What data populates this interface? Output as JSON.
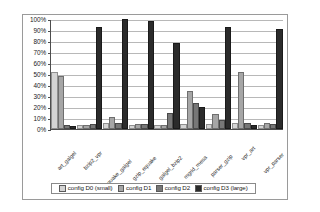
{
  "chart_data": {
    "type": "bar",
    "title": "",
    "xlabel": "",
    "ylabel": "",
    "ylim": [
      0,
      100
    ],
    "ytick_labels": [
      "100%",
      "90%",
      "80%",
      "70%",
      "60%",
      "50%",
      "40%",
      "30%",
      "20%",
      "10%",
      "0%"
    ],
    "ytick_values": [
      100,
      90,
      80,
      70,
      60,
      50,
      40,
      30,
      20,
      10,
      0
    ],
    "grid": true,
    "legend_position": "bottom",
    "categories": [
      "art_galgel",
      "bzip2_vpr",
      "equake_galgel",
      "gzip_equake",
      "galgel_bzip2",
      "mgrid_mesa",
      "parser_gzip",
      "vpr_art",
      "vpr_parser"
    ],
    "series": [
      {
        "name": "config D0 (small)",
        "color": "#d4d4d4",
        "values": [
          50,
          2,
          4,
          2,
          2,
          3,
          3,
          4,
          2
        ]
      },
      {
        "name": "config D1",
        "color": "#a6a6a6",
        "values": [
          46,
          2,
          9,
          3,
          2,
          33,
          12,
          50,
          4
        ]
      },
      {
        "name": "config D2",
        "color": "#777777",
        "values": [
          2,
          3,
          4,
          3,
          13,
          22,
          6,
          4,
          3
        ]
      },
      {
        "name": "config D3 (large)",
        "color": "#2b2b2b",
        "values": [
          1,
          91,
          98,
          96,
          76,
          18,
          91,
          2,
          89
        ]
      }
    ]
  },
  "legend": {
    "items": [
      {
        "label": "config D0 (small)",
        "color": "#d4d4d4"
      },
      {
        "label": "config D1",
        "color": "#a6a6a6"
      },
      {
        "label": "config D2",
        "color": "#777777"
      },
      {
        "label": "config D3 (large)",
        "color": "#2b2b2b"
      }
    ]
  }
}
